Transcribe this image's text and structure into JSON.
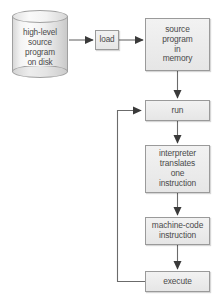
{
  "diagram": {
    "canvas": {
      "width": 220,
      "height": 308,
      "background": "#ffffff"
    },
    "style": {
      "node_fill": "#ececec",
      "node_border": "#9a9a9a",
      "text_color": "#4a4a4a",
      "connector_color": "#6b6b6b",
      "arrowhead_color": "#3a3a3a"
    },
    "nodes": [
      {
        "id": "disk",
        "shape": "cylinder",
        "label": "high-level\nsource\nprogram\non disk",
        "label_lines": [
          "high-level",
          "source",
          "program",
          "on disk"
        ]
      },
      {
        "id": "load",
        "shape": "rectangle",
        "label": "load",
        "label_lines": [
          "load"
        ]
      },
      {
        "id": "source_memory",
        "shape": "rectangle",
        "label": "source\nprogram\nin\nmemory",
        "label_lines": [
          "source",
          "program",
          "in",
          "memory"
        ]
      },
      {
        "id": "run",
        "shape": "rectangle",
        "label": "run",
        "label_lines": [
          "run"
        ]
      },
      {
        "id": "interpreter",
        "shape": "rectangle",
        "label": "interpreter\ntranslates\none\ninstruction",
        "label_lines": [
          "interpreter",
          "translates",
          "one",
          "instruction"
        ]
      },
      {
        "id": "machine_code",
        "shape": "rectangle",
        "label": "machine-code\ninstruction",
        "label_lines": [
          "machine-code",
          "instruction"
        ]
      },
      {
        "id": "execute",
        "shape": "rectangle",
        "label": "execute",
        "label_lines": [
          "execute"
        ]
      }
    ],
    "edges": [
      {
        "id": "disk-to-load",
        "from": "disk",
        "to": "load",
        "label": "",
        "arrow": true
      },
      {
        "id": "load-to-source-memory",
        "from": "load",
        "to": "source_memory",
        "label": "",
        "arrow": true
      },
      {
        "id": "source-memory-to-run",
        "from": "source_memory",
        "to": "run",
        "label": "",
        "arrow": true
      },
      {
        "id": "run-to-interpreter",
        "from": "run",
        "to": "interpreter",
        "label": "",
        "arrow": true
      },
      {
        "id": "interpreter-to-machine",
        "from": "interpreter",
        "to": "machine_code",
        "label": "",
        "arrow": true
      },
      {
        "id": "machine-to-execute",
        "from": "machine_code",
        "to": "execute",
        "label": "",
        "arrow": true
      },
      {
        "id": "execute-loop-back-to-run",
        "from": "execute",
        "to": "run",
        "label": "",
        "arrow": true
      }
    ]
  }
}
